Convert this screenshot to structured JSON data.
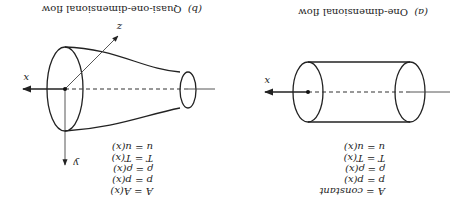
{
  "orientation": "rotated-180",
  "figure_a": {
    "caption_label": "(a)",
    "caption_text": "One-dimensional flow",
    "axis_label_x": "x",
    "equations": [
      "A = constant",
      "p = p(x)",
      "ρ = ρ(x)",
      "T = T(x)",
      "u = u(x)"
    ]
  },
  "figure_b": {
    "caption_label": "(b)",
    "caption_text": "Quasi-one-dimensional flow",
    "axis_label_x": "x",
    "axis_label_y": "y",
    "axis_label_z": "z",
    "equations": [
      "A = A(x)",
      "p = p(x)",
      "ρ = ρ(x)",
      "T = T(x)",
      "u = u(x)"
    ]
  }
}
